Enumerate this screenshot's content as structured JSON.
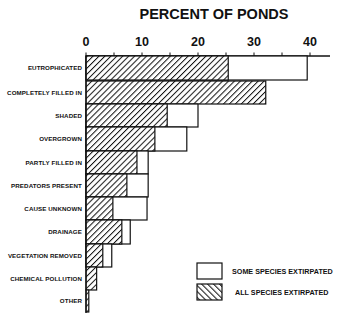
{
  "chart_data": {
    "type": "bar",
    "orientation": "horizontal",
    "stacked": true,
    "title": "PERCENT OF PONDS",
    "xlabel": "PERCENT OF PONDS",
    "ylabel": "",
    "xlim": [
      0,
      43
    ],
    "x_ticks": [
      0,
      10,
      20,
      30,
      40
    ],
    "x_minor_tick_interval": 5,
    "axis_position": "top",
    "grid": false,
    "legend_position": "lower right",
    "categories": [
      "EUTROPHICATED",
      "COMPLETELY FILLED IN",
      "SHADED",
      "OVERGROWN",
      "PARTLY FILLED IN",
      "PREDATORS PRESENT",
      "CAUSE UNKNOWN",
      "DRAINAGE",
      "VEGETATION REMOVED",
      "CHEMICAL POLLUTION",
      "OTHER"
    ],
    "series": [
      {
        "name": "ALL SPECIES EXTIRPATED",
        "pattern": "hatched",
        "values": [
          25.4,
          32.1,
          14.5,
          12.3,
          9.1,
          7.3,
          4.8,
          6.4,
          3.0,
          1.9,
          0.5
        ]
      },
      {
        "name": "SOME SPECIES EXTIRPATED",
        "pattern": "open",
        "values": [
          14.1,
          0,
          5.5,
          5.7,
          2.0,
          3.8,
          6.1,
          1.5,
          1.6,
          0,
          0
        ]
      }
    ],
    "totals": [
      39.5,
      32.1,
      20.0,
      18.0,
      11.1,
      11.1,
      10.9,
      7.9,
      4.6,
      1.9,
      0.5
    ]
  },
  "legend": {
    "items": [
      {
        "label": "SOME SPECIES EXTIRPATED",
        "pattern": "open"
      },
      {
        "label": "ALL SPECIES EXTIRPATED",
        "pattern": "hatched"
      }
    ]
  },
  "colors": {
    "ink": "#111111",
    "background": "#ffffff"
  }
}
